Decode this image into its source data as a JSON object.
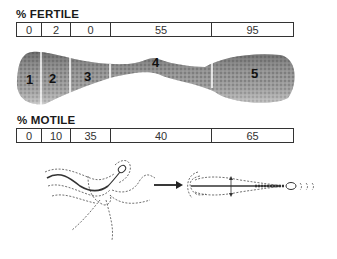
{
  "fertile": {
    "heading": "% FERTILE",
    "values": [
      "0",
      "2",
      "0",
      "55",
      "95"
    ]
  },
  "motile": {
    "heading": "% MOTILE",
    "values": [
      "0",
      "10",
      "35",
      "40",
      "65"
    ]
  },
  "organ": {
    "segments": [
      "1",
      "2",
      "3",
      "4",
      "5"
    ]
  },
  "illustration": {
    "description": "immature sperm with disorganized flagellar beat -> mature sperm with progressive motility",
    "arrow": "right-arrow"
  }
}
